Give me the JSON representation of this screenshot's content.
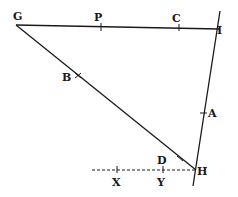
{
  "diagram": {
    "type": "geometric-figure",
    "points": {
      "G": {
        "label": "G",
        "x": 16,
        "y": 25
      },
      "P": {
        "label": "P",
        "x": 100,
        "y": 27
      },
      "C": {
        "label": "C",
        "x": 179,
        "y": 28
      },
      "I": {
        "label": "I",
        "x": 216,
        "y": 28
      },
      "B": {
        "label": "B",
        "x": 79,
        "y": 75
      },
      "A": {
        "label": "A",
        "x": 204,
        "y": 113
      },
      "D": {
        "label": "D",
        "x": 179,
        "y": 158
      },
      "H": {
        "label": "H",
        "x": 196,
        "y": 170
      },
      "X": {
        "label": "X",
        "x": 117,
        "y": 170
      },
      "Y": {
        "label": "Y",
        "x": 163,
        "y": 170
      }
    },
    "segments": [
      {
        "from": "G",
        "to": "I",
        "style": "solid"
      },
      {
        "from": "G",
        "to": "H",
        "style": "solid"
      },
      {
        "from": "I",
        "to": "H",
        "style": "solid",
        "extended": true
      },
      {
        "from": "H",
        "to": "X",
        "style": "dashed",
        "extended": true
      }
    ]
  }
}
